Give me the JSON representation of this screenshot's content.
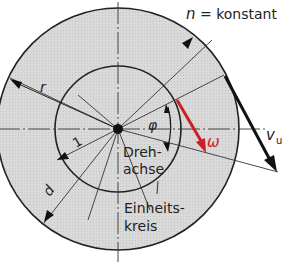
{
  "title": "n = konstant",
  "labels": {
    "n": "n",
    "equals": "= konstant",
    "r": "r",
    "one": "1",
    "d": "d",
    "phi": "φ",
    "omega": "ω",
    "vu_v": "v",
    "vu_sub": "u",
    "drehachse_1": "Dreh-",
    "drehachse_2": "achse",
    "einheitskreis_1": "Einheits-",
    "einheitskreis_2": "kreis"
  },
  "colors": {
    "disk_fill": "#d6d6d6",
    "inner_fill": "#cfcfcf",
    "line": "#222222",
    "omega_arrow": "#cc1f24",
    "vu_arrow": "#111111"
  }
}
